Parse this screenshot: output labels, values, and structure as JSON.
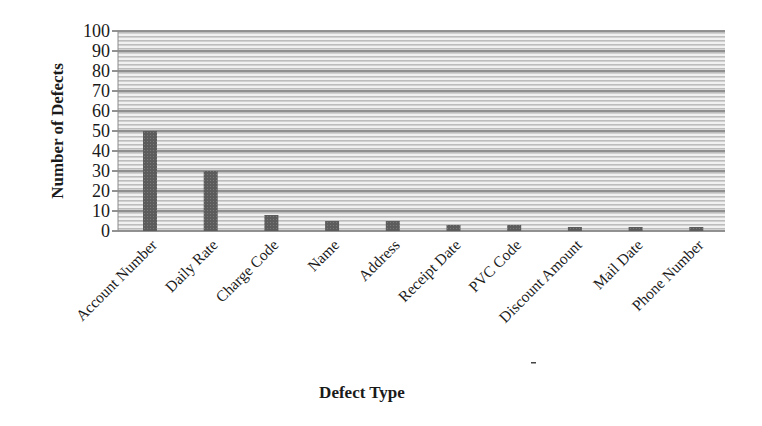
{
  "chart_data": {
    "type": "bar",
    "title": "",
    "xlabel": "Defect Type",
    "ylabel": "Number of Defects",
    "categories": [
      "Account Number",
      "Daily Rate",
      "Charge Code",
      "Name",
      "Address",
      "Receipt Date",
      "PVC Code",
      "Discount Amount",
      "Mail Date",
      "Phone Number"
    ],
    "values": [
      50,
      30,
      8,
      5,
      5,
      3,
      3,
      2,
      2,
      2
    ],
    "ylim": [
      0,
      100
    ],
    "yticks": [
      0,
      10,
      20,
      30,
      40,
      50,
      60,
      70,
      80,
      90,
      100
    ],
    "grid": true,
    "legend": null,
    "colors": {
      "bar": "#5a5a5a",
      "plot_background": "#d6d6d6",
      "stripe": "#eeeeee",
      "gridline": "#6e6e6e"
    }
  }
}
